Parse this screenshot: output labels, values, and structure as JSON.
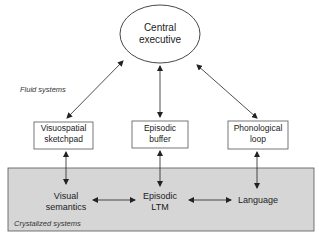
{
  "diagram": {
    "nodes": {
      "central_executive": {
        "line1": "Central",
        "line2": "executive"
      },
      "visuospatial": {
        "line1": "Visuospatial",
        "line2": "sketchpad"
      },
      "episodic_buffer": {
        "line1": "Episodic",
        "line2": "buffer"
      },
      "phonological": {
        "line1": "Phonological",
        "line2": "loop"
      },
      "visual_semantics": {
        "line1": "Visual",
        "line2": "semantics"
      },
      "episodic_ltm": {
        "line1": "Episodic",
        "line2": "LTM"
      },
      "language": {
        "line1": "Language"
      }
    },
    "regions": {
      "fluid": "Fluid systems",
      "crystallized": "Crystalized systems"
    },
    "colors": {
      "shaded_region": "#d6d6d6",
      "line": "#333333"
    },
    "edges": [
      {
        "from": "central_executive",
        "to": "visuospatial",
        "type": "bidirectional"
      },
      {
        "from": "central_executive",
        "to": "episodic_buffer",
        "type": "bidirectional"
      },
      {
        "from": "central_executive",
        "to": "phonological",
        "type": "bidirectional"
      },
      {
        "from": "visuospatial",
        "to": "visual_semantics",
        "type": "bidirectional"
      },
      {
        "from": "episodic_buffer",
        "to": "episodic_ltm",
        "type": "bidirectional"
      },
      {
        "from": "phonological",
        "to": "language",
        "type": "bidirectional"
      },
      {
        "from": "visual_semantics",
        "to": "episodic_ltm",
        "type": "bidirectional"
      },
      {
        "from": "episodic_ltm",
        "to": "language",
        "type": "bidirectional"
      }
    ]
  }
}
